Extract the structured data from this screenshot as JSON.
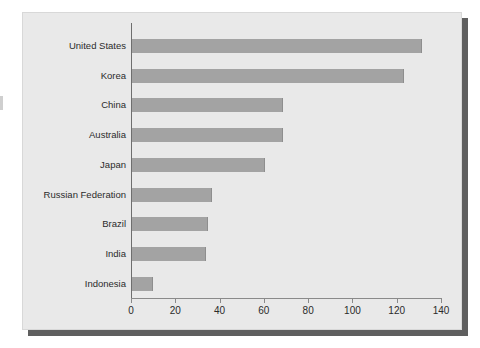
{
  "chart_data": {
    "type": "bar",
    "orientation": "horizontal",
    "title": "",
    "subtitle": "",
    "xlabel": "",
    "ylabel": "",
    "categories": [
      "United States",
      "Korea",
      "China",
      "Australia",
      "Japan",
      "Russian Federation",
      "Brazil",
      "India",
      "Indonesia"
    ],
    "values": [
      131,
      123,
      68,
      68,
      60,
      36,
      34.5,
      33.5,
      9.5
    ],
    "xlim": [
      0,
      140
    ],
    "xticks": [
      0,
      20,
      40,
      60,
      80,
      100,
      120,
      140
    ],
    "xtick_labels": [
      "0",
      "20",
      "40",
      "60",
      "80",
      "100",
      "120",
      "140"
    ],
    "grid": false,
    "legend": null,
    "bar_color": "#a3a3a3",
    "plot_background": "#e9e9e9",
    "axis_color": "#6e6e6e",
    "text_color": "#2b2b2b"
  },
  "figure": {
    "shadow_color": "#5f5f5f",
    "panel_border_color": "#d8d8d8"
  }
}
